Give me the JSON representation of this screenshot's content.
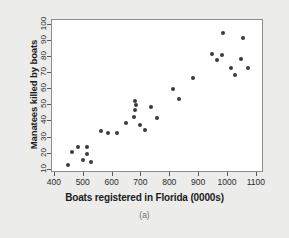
{
  "chart_data": {
    "type": "scatter",
    "title": "",
    "caption": "(a)",
    "xlabel": "Boats registered in Florida (0000s)",
    "ylabel": "Manatees killed by boats",
    "xlim": [
      390,
      1125
    ],
    "ylim": [
      8,
      103
    ],
    "xticks": [
      400,
      500,
      600,
      700,
      800,
      900,
      1000,
      1100
    ],
    "yticks": [
      10,
      20,
      30,
      40,
      50,
      60,
      70,
      80,
      90,
      100
    ],
    "grid": false,
    "legend": null,
    "marker": {
      "shape": "circle",
      "color": "#3b3b3b",
      "size": 4
    },
    "points": [
      {
        "x": 447,
        "y": 13
      },
      {
        "x": 460,
        "y": 21
      },
      {
        "x": 481,
        "y": 24
      },
      {
        "x": 498,
        "y": 16
      },
      {
        "x": 513,
        "y": 24
      },
      {
        "x": 512,
        "y": 20
      },
      {
        "x": 526,
        "y": 15
      },
      {
        "x": 559,
        "y": 34
      },
      {
        "x": 585,
        "y": 33
      },
      {
        "x": 614,
        "y": 33
      },
      {
        "x": 645,
        "y": 39
      },
      {
        "x": 675,
        "y": 43
      },
      {
        "x": 681,
        "y": 50
      },
      {
        "x": 679,
        "y": 47
      },
      {
        "x": 678,
        "y": 53
      },
      {
        "x": 696,
        "y": 38
      },
      {
        "x": 713,
        "y": 35
      },
      {
        "x": 732,
        "y": 49
      },
      {
        "x": 755,
        "y": 42
      },
      {
        "x": 809,
        "y": 60
      },
      {
        "x": 830,
        "y": 54
      },
      {
        "x": 880,
        "y": 67
      },
      {
        "x": 944,
        "y": 82
      },
      {
        "x": 962,
        "y": 78
      },
      {
        "x": 978,
        "y": 81
      },
      {
        "x": 983,
        "y": 95
      },
      {
        "x": 1010,
        "y": 73
      },
      {
        "x": 1024,
        "y": 69
      },
      {
        "x": 1046,
        "y": 79
      },
      {
        "x": 1052,
        "y": 92
      },
      {
        "x": 1068,
        "y": 73
      }
    ]
  }
}
